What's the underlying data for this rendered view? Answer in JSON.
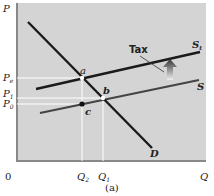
{
  "diagram": {
    "axes": {
      "y_label": "P",
      "x_label": "Q",
      "origin": "0"
    },
    "price_labels": {
      "pe": "P",
      "pe_sub": "e",
      "p1": "P",
      "p1_sub": "1",
      "p0": "P",
      "p0_sub": "0"
    },
    "quantity_labels": {
      "q2": "Q",
      "q2_sub": "2",
      "q1": "Q",
      "q1_sub": "1"
    },
    "curves": {
      "demand": "D",
      "supply": "S",
      "supply_tax": "S",
      "supply_tax_sub": "t"
    },
    "points": {
      "a": "a",
      "b": "b",
      "c": "c"
    },
    "annotation": "Tax",
    "caption": "(a)",
    "colors": {
      "background": "#d4d4d4",
      "curve": "#1a1a1a",
      "supply": "#444444",
      "grid": "#ffffff"
    }
  }
}
